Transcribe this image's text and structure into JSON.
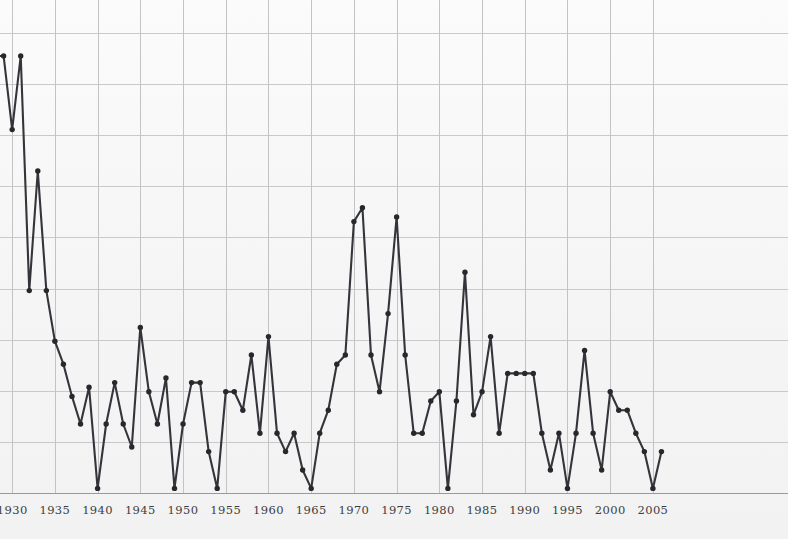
{
  "chart_data": {
    "type": "line",
    "title": "",
    "subtitle": "",
    "xlabel": "",
    "ylabel": "",
    "xlim": [
      1926,
      2007
    ],
    "ylim": [
      0,
      100
    ],
    "grid": true,
    "grid_x_interval": 5,
    "grid_y_count": 10,
    "legend": "none",
    "legend_entries": [],
    "annotations": [],
    "marker": "circle",
    "line_color": "#33353a",
    "marker_color": "#26282c",
    "background_color": "#f6f6f6",
    "gridline_color": "#c9c9c9",
    "axis_color": "#9a9a9a",
    "x_tick_labels": [
      "1930",
      "1935",
      "1940",
      "1945",
      "1950",
      "1955",
      "1960",
      "1965",
      "1970",
      "1975",
      "1980",
      "1985",
      "1990",
      "1995",
      "2000",
      "2005"
    ],
    "x_tick_values": [
      1930,
      1935,
      1940,
      1945,
      1950,
      1955,
      1960,
      1965,
      1970,
      1975,
      1980,
      1985,
      1990,
      1995,
      2000,
      2005
    ],
    "y_tick_labels": [],
    "series": [
      {
        "name": "value",
        "x": [
          1926,
          1927,
          1928,
          1929,
          1930,
          1931,
          1932,
          1933,
          1934,
          1935,
          1936,
          1937,
          1938,
          1939,
          1940,
          1941,
          1942,
          1943,
          1944,
          1945,
          1946,
          1947,
          1948,
          1949,
          1950,
          1951,
          1952,
          1953,
          1954,
          1955,
          1956,
          1957,
          1958,
          1959,
          1960,
          1961,
          1962,
          1963,
          1964,
          1965,
          1966,
          1967,
          1968,
          1969,
          1970,
          1971,
          1972,
          1973,
          1974,
          1975,
          1976,
          1977,
          1978,
          1979,
          1980,
          1981,
          1982,
          1983,
          1984,
          1985,
          1986,
          1987,
          1988,
          1989,
          1990,
          1991,
          1992,
          1993,
          1994,
          1995,
          1996,
          1997,
          1998,
          1999,
          2000,
          2001,
          2002,
          2003,
          2004,
          2005,
          2006
        ],
        "y": [
          88,
          93,
          95,
          95,
          79,
          95,
          44,
          70,
          44,
          33,
          28,
          21,
          15,
          23,
          1,
          15,
          24,
          15,
          10,
          36,
          22,
          15,
          25,
          1,
          15,
          24,
          24,
          9,
          1,
          22,
          22,
          18,
          30,
          13,
          34,
          13,
          9,
          13,
          5,
          1,
          13,
          18,
          28,
          30,
          59,
          62,
          30,
          22,
          39,
          60,
          30,
          13,
          13,
          20,
          22,
          1,
          20,
          48,
          17,
          22,
          34,
          13,
          26,
          26,
          26,
          26,
          13,
          5,
          13,
          1,
          13,
          31,
          13,
          5,
          22,
          18,
          18,
          13,
          9,
          1,
          9
        ]
      }
    ]
  },
  "axis_labels": {
    "ticks": [
      {
        "label": "1930",
        "value": 1930
      },
      {
        "label": "1935",
        "value": 1935
      },
      {
        "label": "1940",
        "value": 1940
      },
      {
        "label": "1945",
        "value": 1945
      },
      {
        "label": "1950",
        "value": 1950
      },
      {
        "label": "1955",
        "value": 1955
      },
      {
        "label": "1960",
        "value": 1960
      },
      {
        "label": "1965",
        "value": 1965
      },
      {
        "label": "1970",
        "value": 1970
      },
      {
        "label": "1975",
        "value": 1975
      },
      {
        "label": "1980",
        "value": 1980
      },
      {
        "label": "1985",
        "value": 1985
      },
      {
        "label": "1990",
        "value": 1990
      },
      {
        "label": "1995",
        "value": 1995
      },
      {
        "label": "2000",
        "value": 2000
      },
      {
        "label": "2005",
        "value": 2005
      }
    ]
  }
}
